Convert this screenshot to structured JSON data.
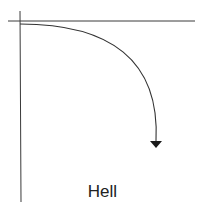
{
  "diagram": {
    "label": "Hell",
    "colors": {
      "line": "#3a3a3a",
      "curve": "#333333",
      "arrowhead": "#1a1a1a",
      "text": "#222222",
      "background": "#ffffff"
    },
    "axes": {
      "horizontal": {
        "x1": 8,
        "y1": 21,
        "x2": 195,
        "y2": 21
      },
      "vertical": {
        "x1": 20,
        "y1": 11,
        "x2": 21,
        "y2": 202
      }
    },
    "curve": {
      "start": [
        20,
        24
      ],
      "control1": [
        110,
        24
      ],
      "control2": [
        160,
        60
      ],
      "end": [
        156,
        141
      ]
    },
    "arrowhead": {
      "points": "150,141 162,141 156,148"
    }
  }
}
